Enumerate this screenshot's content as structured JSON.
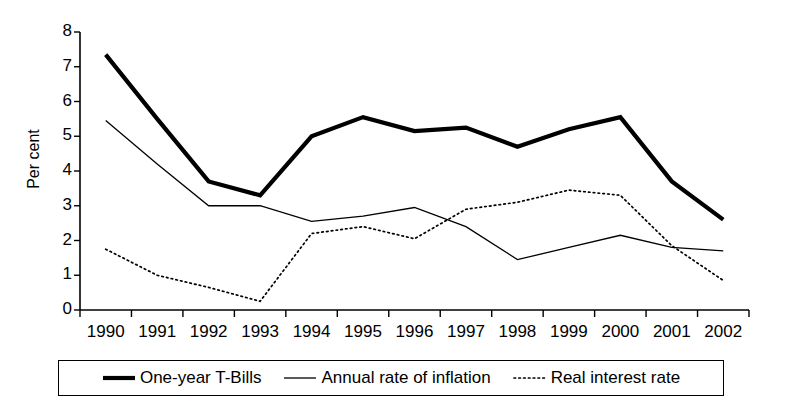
{
  "chart_data": {
    "type": "line",
    "title": "",
    "xlabel": "",
    "ylabel": "Per cent",
    "categories": [
      "1990",
      "1991",
      "1992",
      "1993",
      "1994",
      "1995",
      "1996",
      "1997",
      "1998",
      "1999",
      "2000",
      "2001",
      "2002"
    ],
    "ylim": [
      0,
      8
    ],
    "yticks": [
      0,
      1,
      2,
      3,
      4,
      5,
      6,
      7,
      8
    ],
    "grid": false,
    "legend_position": "bottom",
    "series": [
      {
        "name": "One-year T-Bills",
        "style": "thick-solid",
        "color": "#000000",
        "values": [
          7.35,
          5.5,
          3.7,
          3.3,
          5.0,
          5.55,
          5.15,
          5.25,
          4.7,
          5.2,
          5.55,
          3.7,
          2.6
        ]
      },
      {
        "name": "Annual rate of inflation",
        "style": "thin-solid",
        "color": "#000000",
        "values": [
          5.45,
          4.2,
          3.0,
          3.0,
          2.55,
          2.7,
          2.95,
          2.4,
          1.45,
          1.8,
          2.15,
          1.8,
          1.7
        ]
      },
      {
        "name": "Real interest rate",
        "style": "dotted",
        "color": "#000000",
        "values": [
          1.75,
          1.0,
          0.65,
          0.25,
          2.2,
          2.4,
          2.05,
          2.9,
          3.1,
          3.45,
          3.3,
          1.85,
          0.85
        ]
      }
    ]
  },
  "axis": {
    "y_label": "Per cent",
    "y_tick_labels": [
      "0",
      "1",
      "2",
      "3",
      "4",
      "5",
      "6",
      "7",
      "8"
    ],
    "x_tick_labels": [
      "1990",
      "1991",
      "1992",
      "1993",
      "1994",
      "1995",
      "1996",
      "1997",
      "1998",
      "1999",
      "2000",
      "2001",
      "2002"
    ]
  },
  "legend": {
    "items": [
      {
        "label": "One-year T-Bills",
        "marker": "thick-line-swatch"
      },
      {
        "label": "Annual rate of inflation",
        "marker": "thin-line-swatch"
      },
      {
        "label": "Real interest rate",
        "marker": "dotted-line-swatch"
      }
    ]
  }
}
